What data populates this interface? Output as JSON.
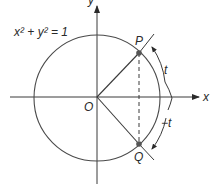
{
  "diagram": {
    "equation": "x² + y² = 1",
    "origin_label": "O",
    "x_axis_label": "x",
    "y_axis_label": "y",
    "point_p_label": "P",
    "point_q_label": "Q",
    "arc_upper_label": "t",
    "arc_lower_label": "−t",
    "colors": {
      "stroke": "#3a3a3a",
      "point": "#555555",
      "background": "#ffffff"
    }
  }
}
